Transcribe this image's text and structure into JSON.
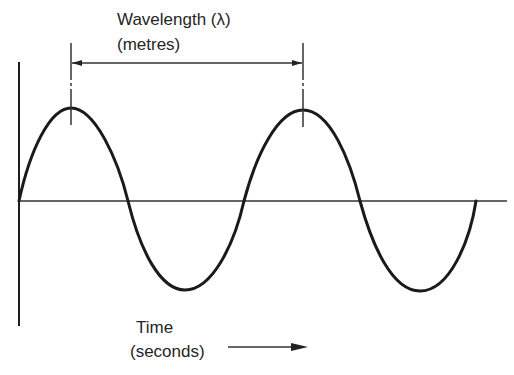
{
  "diagram": {
    "wavelength_label": "Wavelength (λ)",
    "wavelength_unit": "(metres)",
    "time_label": "Time",
    "time_unit": "(seconds)",
    "colors": {
      "line": "#1e1e1e",
      "background": "#ffffff"
    },
    "wave": {
      "cycles": 2,
      "peaks_x": [
        71,
        303
      ],
      "troughs_x": [
        185,
        420
      ],
      "zero_crossings_x": [
        19,
        128,
        244,
        360,
        476
      ]
    }
  }
}
